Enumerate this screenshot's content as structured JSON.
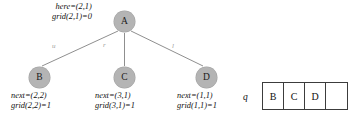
{
  "diagram": {
    "type": "search-tree-with-queue",
    "root": {
      "id": "node-a",
      "label": "A",
      "annotation": {
        "line1_name": "here",
        "line1": "here=(2,1)",
        "line2_name": "grid",
        "line2": "grid(2,1)=0"
      }
    },
    "children": [
      {
        "id": "node-b",
        "label": "B",
        "edge_label": "u",
        "annotation": {
          "line1": "next=(2,2)",
          "line2": "grid(2,2)=1"
        }
      },
      {
        "id": "node-c",
        "label": "C",
        "edge_label": "r",
        "annotation": {
          "line1": "next=(3,1)",
          "line2": "grid(3,1)=1"
        }
      },
      {
        "id": "node-d",
        "label": "D",
        "edge_label": "l",
        "annotation": {
          "line1": "next=(1,1)",
          "line2": "grid(1,1)=1"
        }
      }
    ],
    "queue": {
      "label": "q",
      "cells": [
        "B",
        "C",
        "D",
        ""
      ]
    },
    "colors": {
      "node_fill": "#b4b4b4",
      "node_text": "#1a1a1a",
      "edge_stroke": "#8f8f8f",
      "annotation_text": "#111111",
      "edge_label_text": "#9a9a9a",
      "queue_border": "#3c3c3c",
      "background": "#ffffff"
    }
  }
}
